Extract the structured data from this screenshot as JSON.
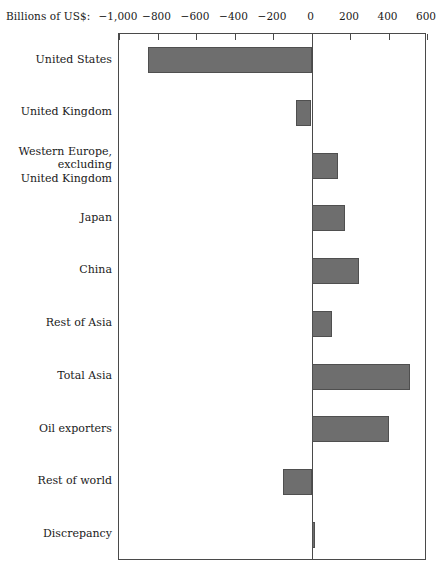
{
  "chart_data": {
    "type": "bar",
    "orientation": "horizontal",
    "title": "",
    "subtitle": "",
    "xlabel": "Billions of US$:",
    "ylabel": "",
    "grid": false,
    "legend": null,
    "xlim": [
      -1000,
      600
    ],
    "xticks": [
      -1000,
      -800,
      -600,
      -400,
      -200,
      0,
      200,
      400,
      600
    ],
    "xtick_labels": [
      "−1,000",
      "−800",
      "−600",
      "−400",
      "−200",
      "0",
      "200",
      "400",
      "600"
    ],
    "categories": [
      "United States",
      "United Kingdom",
      "Western Europe,\nexcluding\nUnited Kingdom",
      "Japan",
      "China",
      "Rest of Asia",
      "Total Asia",
      "Oil exporters",
      "Rest of world",
      "Discrepancy"
    ],
    "values": [
      -850,
      -80,
      138,
      174,
      246,
      107,
      512,
      403,
      -150,
      18
    ],
    "bar_color": "#6e6e6e",
    "bar_edge_color": "#4f4f4f",
    "frame_color": "#4a4a4a",
    "background": "#ffffff"
  },
  "axis_caption": "Billions of US$:"
}
